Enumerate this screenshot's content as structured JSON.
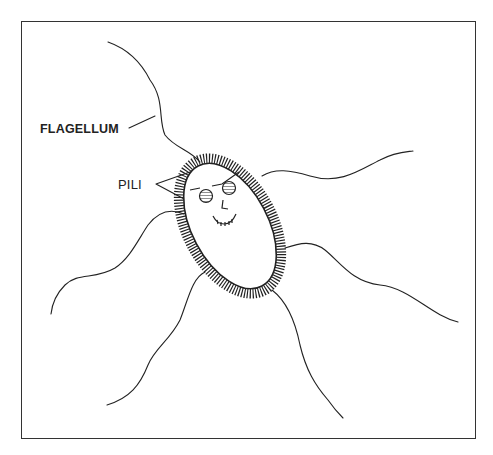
{
  "diagram": {
    "labels": {
      "flagellum": "FLAGELLUM",
      "pili": "PILI"
    },
    "colors": {
      "ink": "#222222",
      "background": "#ffffff"
    }
  }
}
